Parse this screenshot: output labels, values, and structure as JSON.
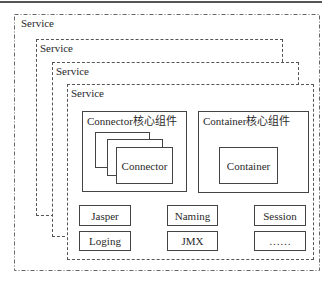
{
  "diagram": {
    "services": [
      {
        "label": "Service",
        "line_style": "dash-dot"
      },
      {
        "label": "Service",
        "line_style": "dashed"
      },
      {
        "label": "Service",
        "line_style": "dashed"
      },
      {
        "label": "Service",
        "line_style": "dashed"
      }
    ],
    "connector_group": {
      "title": "Connector核心组件",
      "items": [
        "",
        "",
        "Connector"
      ]
    },
    "container_group": {
      "title": "Container核心组件",
      "item": "Container"
    },
    "components": [
      [
        "Jasper",
        "Naming",
        "Session"
      ],
      [
        "Loging",
        "JMX",
        "……"
      ]
    ],
    "colors": {
      "line": "#444444",
      "background": "#ffffff"
    }
  }
}
